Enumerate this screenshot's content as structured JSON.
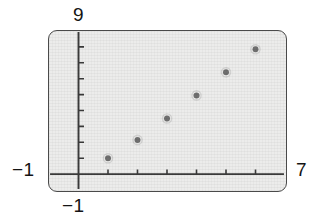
{
  "screen": {
    "device": "graphing-calculator-screen",
    "background_color": "#ececeb",
    "border_color": "#4a4a4a"
  },
  "labels": {
    "y_max": "9",
    "y_min": "−1",
    "x_min": "−1",
    "x_max": "7"
  },
  "chart_data": {
    "type": "scatter",
    "title": "",
    "xlabel": "",
    "ylabel": "",
    "xlim": [
      -1,
      7
    ],
    "ylim": [
      -1,
      9
    ],
    "grid": false,
    "legend": null,
    "x_tick_interval": 1,
    "y_tick_interval": 1,
    "axis_color": "#3a3a3a",
    "marker_color": "#6f6f6f",
    "marker_size": 6,
    "x": [
      1,
      2,
      3,
      4,
      5,
      6
    ],
    "y": [
      1,
      2.15,
      3.5,
      4.95,
      6.4,
      7.85
    ],
    "points": [
      {
        "x": 1,
        "y": 1
      },
      {
        "x": 2,
        "y": 2.15
      },
      {
        "x": 3,
        "y": 3.5
      },
      {
        "x": 4,
        "y": 4.95
      },
      {
        "x": 5,
        "y": 6.4
      },
      {
        "x": 6,
        "y": 7.85
      }
    ]
  }
}
